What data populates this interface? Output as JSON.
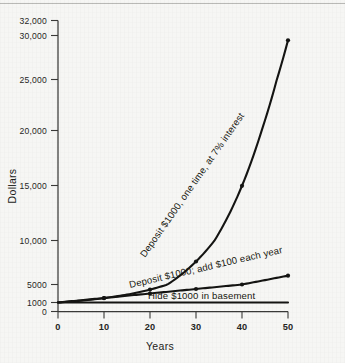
{
  "figure": {
    "kind": "line-chart",
    "background_color": "#f6f6f4",
    "ink_color": "#141412"
  },
  "axes": {
    "x_title": "Years",
    "y_title": "Dollars",
    "x_ticks": [
      "0",
      "10",
      "20",
      "30",
      "40",
      "50"
    ],
    "y_ticks": [
      "0",
      "1000",
      "5000",
      "10,000",
      "15,000",
      "20,000",
      "25,000",
      "30,000",
      "32,000"
    ]
  },
  "series_labels": {
    "exponential": "Deposit $1000, one time, at 7% interest",
    "linear": "Deposit $1000; add $100 each year",
    "flat": "Hide $1000 in basement"
  },
  "chart_data": {
    "type": "line",
    "title": "",
    "subtitle": "",
    "xlabel": "Years",
    "ylabel": "Dollars",
    "xlim": [
      0,
      50
    ],
    "ylim": [
      0,
      32000
    ],
    "xticks": [
      0,
      10,
      20,
      30,
      40,
      50
    ],
    "yticks": [
      0,
      1000,
      5000,
      10000,
      15000,
      20000,
      25000,
      30000,
      32000
    ],
    "ytick_labels": [
      "0",
      "1000",
      "5000",
      "10,000",
      "15,000",
      "20,000",
      "25,000",
      "30,000",
      "32,000"
    ],
    "grid": false,
    "legend": "inline-annotations",
    "x": [
      0,
      10,
      20,
      30,
      40,
      50
    ],
    "series": [
      {
        "name": "Deposit $1000, one time, at 7% interest",
        "annotation": "Deposit $1000, one time, at 7% interest",
        "values": [
          1000,
          1967,
          3870,
          7612,
          14974,
          29457
        ],
        "markers": true
      },
      {
        "name": "Deposit $1000; add $100 each year",
        "annotation": "Deposit $1000; add $100 each year",
        "values": [
          1000,
          2000,
          3000,
          4000,
          5000,
          6000
        ],
        "markers": true
      },
      {
        "name": "Hide $1000 in basement",
        "annotation": "Hide $1000 in basement",
        "values": [
          1000,
          1000,
          1000,
          1000,
          1000,
          1000
        ],
        "markers": false
      }
    ],
    "annotations": [
      {
        "text": "Deposit $1000, one time, at 7% interest",
        "rotation": -55
      },
      {
        "text": "Deposit $1000; add $100 each year",
        "rotation": -13
      },
      {
        "text": "Hide $1000 in basement",
        "rotation": 0
      }
    ]
  }
}
